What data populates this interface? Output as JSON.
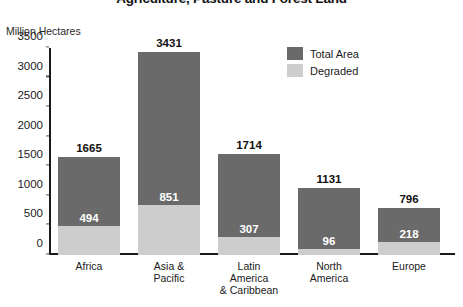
{
  "chart_data": {
    "type": "bar",
    "subtype": "stacked-bar",
    "title": "Agriculture, Pasture and Forest Land",
    "ylabel": "Million Hectares",
    "xlabel": "",
    "ylim": [
      0,
      3500
    ],
    "yticks": [
      0,
      500,
      1000,
      1500,
      2000,
      2500,
      3000,
      3500
    ],
    "ytick_labels": [
      "0",
      "500",
      "1000",
      "1500",
      "2000",
      "2500",
      "3000",
      "3500"
    ],
    "grid": false,
    "legend_position": "top-right",
    "categories": [
      "Africa",
      "Asia & Pacific",
      "Latin America & Caribbean",
      "North America",
      "Europe"
    ],
    "category_lines": [
      [
        "Africa"
      ],
      [
        "Asia &",
        "Pacific"
      ],
      [
        "Latin",
        "America",
        "& Caribbean"
      ],
      [
        "North",
        "America"
      ],
      [
        "Europe"
      ]
    ],
    "series": [
      {
        "name": "Total Area",
        "color": "#6a6a6a",
        "values": [
          1665,
          3431,
          1714,
          1131,
          796
        ]
      },
      {
        "name": "Degraded",
        "color": "#cdcdcd",
        "values": [
          494,
          851,
          307,
          96,
          218
        ]
      }
    ],
    "bars": [
      {
        "category": "Africa",
        "total": 1665,
        "degraded": 494,
        "total_label": "1665",
        "degraded_label": "494"
      },
      {
        "category": "Asia & Pacific",
        "total": 3431,
        "degraded": 851,
        "total_label": "3431",
        "degraded_label": "851"
      },
      {
        "category": "Latin America & Caribbean",
        "total": 1714,
        "degraded": 307,
        "total_label": "1714",
        "degraded_label": "307"
      },
      {
        "category": "North America",
        "total": 1131,
        "degraded": 96,
        "total_label": "1131",
        "degraded_label": "96"
      },
      {
        "category": "Europe",
        "total": 796,
        "degraded": 218,
        "total_label": "796",
        "degraded_label": "218"
      }
    ],
    "legend": [
      {
        "label": "Total Area",
        "color": "#6a6a6a"
      },
      {
        "label": "Degraded",
        "color": "#cdcdcd"
      }
    ]
  }
}
